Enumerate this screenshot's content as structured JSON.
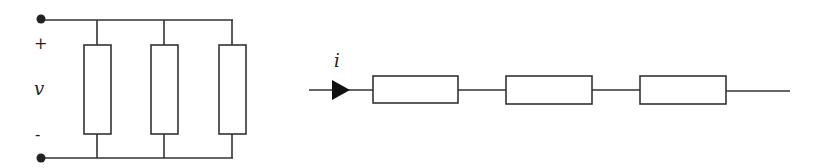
{
  "diagram": {
    "parallel_circuit": {
      "labels": {
        "plus": "+",
        "voltage": "v",
        "minus": "-"
      },
      "resistor_count": 3
    },
    "series_circuit": {
      "labels": {
        "current": "i"
      },
      "resistor_count": 3
    },
    "colors": {
      "line": "#333333",
      "background": "#ffffff"
    }
  }
}
